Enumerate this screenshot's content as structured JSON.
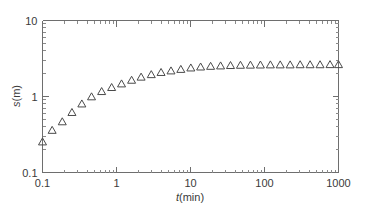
{
  "chart_data": {
    "type": "scatter",
    "title": "",
    "xlabel": "t(min)",
    "ylabel": "s(m)",
    "xscale": "log",
    "yscale": "log",
    "xlim": [
      0.1,
      1000
    ],
    "ylim": [
      0.1,
      10
    ],
    "grid": false,
    "legend": null,
    "marker": "open-triangle-up",
    "marker_color": "#4a4a4a",
    "x_tick_labels": [
      "0.1",
      "1",
      "10",
      "100",
      "1000"
    ],
    "x_tick_values": [
      0.1,
      1,
      10,
      100,
      1000
    ],
    "y_tick_labels": [
      "0.1",
      "1",
      "10"
    ],
    "y_tick_values": [
      0.1,
      1,
      10
    ],
    "series": [
      {
        "name": "s vs t",
        "x": [
          0.1,
          0.135,
          0.185,
          0.25,
          0.34,
          0.46,
          0.63,
          0.86,
          1.17,
          1.6,
          2.15,
          2.95,
          4.0,
          5.45,
          7.4,
          10.1,
          13.7,
          18.7,
          25.5,
          34.7,
          47.3,
          64.5,
          88.0,
          120.0,
          163.0,
          222.0,
          303.0,
          413.0,
          563.0,
          768.0,
          1000.0
        ],
        "y": [
          0.25,
          0.355,
          0.46,
          0.61,
          0.79,
          0.98,
          1.15,
          1.3,
          1.45,
          1.62,
          1.78,
          1.92,
          2.05,
          2.15,
          2.25,
          2.35,
          2.42,
          2.47,
          2.5,
          2.53,
          2.55,
          2.56,
          2.57,
          2.58,
          2.58,
          2.58,
          2.59,
          2.59,
          2.59,
          2.6,
          2.6
        ]
      }
    ]
  },
  "axes": {
    "x_title_italic": "t",
    "x_title_rest": "(min)",
    "y_title_italic": "s",
    "y_title_rest": "(m)"
  }
}
